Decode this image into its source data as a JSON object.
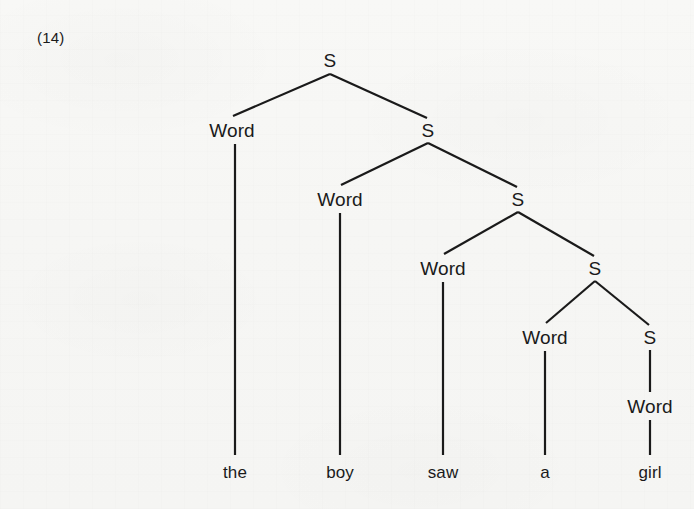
{
  "example": {
    "number_label": "(14)"
  },
  "figure": {
    "type": "syntax-tree",
    "sentence": "the boy saw a girl",
    "nonterminal_label": "S",
    "preterminal_label": "Word"
  },
  "tree": {
    "nodes": [
      {
        "id": "S1",
        "label": "S",
        "x": 330,
        "y": 60,
        "kind": "nonterminal"
      },
      {
        "id": "Word1",
        "label": "Word",
        "x": 232,
        "y": 130,
        "kind": "preterminal"
      },
      {
        "id": "S2",
        "label": "S",
        "x": 428,
        "y": 130,
        "kind": "nonterminal"
      },
      {
        "id": "Word2",
        "label": "Word",
        "x": 340,
        "y": 199,
        "kind": "preterminal"
      },
      {
        "id": "S3",
        "label": "S",
        "x": 518,
        "y": 199,
        "kind": "nonterminal"
      },
      {
        "id": "Word3",
        "label": "Word",
        "x": 443,
        "y": 268,
        "kind": "preterminal"
      },
      {
        "id": "S4",
        "label": "S",
        "x": 595,
        "y": 268,
        "kind": "nonterminal"
      },
      {
        "id": "Word4",
        "label": "Word",
        "x": 545,
        "y": 337,
        "kind": "preterminal"
      },
      {
        "id": "S5",
        "label": "S",
        "x": 650,
        "y": 337,
        "kind": "nonterminal"
      },
      {
        "id": "Word5",
        "label": "Word",
        "x": 650,
        "y": 406,
        "kind": "preterminal"
      }
    ],
    "terminals": [
      {
        "id": "t1",
        "label": "the",
        "x": 235,
        "y": 472
      },
      {
        "id": "t2",
        "label": "boy",
        "x": 340,
        "y": 472
      },
      {
        "id": "t3",
        "label": "saw",
        "x": 443,
        "y": 472
      },
      {
        "id": "t4",
        "label": "a",
        "x": 545,
        "y": 472
      },
      {
        "id": "t5",
        "label": "girl",
        "x": 650,
        "y": 472
      }
    ],
    "edges": [
      {
        "from": "S1",
        "to": "Word1",
        "x1": 330,
        "y1": 74,
        "x2": 233,
        "y2": 116
      },
      {
        "from": "S1",
        "to": "S2",
        "x1": 330,
        "y1": 74,
        "x2": 427,
        "y2": 118
      },
      {
        "from": "S2",
        "to": "Word2",
        "x1": 428,
        "y1": 143,
        "x2": 341,
        "y2": 185
      },
      {
        "from": "S2",
        "to": "S3",
        "x1": 428,
        "y1": 143,
        "x2": 517,
        "y2": 187
      },
      {
        "from": "S3",
        "to": "Word3",
        "x1": 518,
        "y1": 212,
        "x2": 444,
        "y2": 254
      },
      {
        "from": "S3",
        "to": "S4",
        "x1": 518,
        "y1": 212,
        "x2": 594,
        "y2": 256
      },
      {
        "from": "S4",
        "to": "Word4",
        "x1": 595,
        "y1": 281,
        "x2": 546,
        "y2": 323
      },
      {
        "from": "S4",
        "to": "S5",
        "x1": 595,
        "y1": 281,
        "x2": 649,
        "y2": 325
      },
      {
        "from": "S5",
        "to": "Word5",
        "x1": 650,
        "y1": 350,
        "x2": 650,
        "y2": 392
      },
      {
        "from": "Word1",
        "to": "t1",
        "x1": 235,
        "y1": 144,
        "x2": 235,
        "y2": 455
      },
      {
        "from": "Word2",
        "to": "t2",
        "x1": 340,
        "y1": 213,
        "x2": 340,
        "y2": 455
      },
      {
        "from": "Word3",
        "to": "t3",
        "x1": 443,
        "y1": 282,
        "x2": 443,
        "y2": 455
      },
      {
        "from": "Word4",
        "to": "t4",
        "x1": 545,
        "y1": 351,
        "x2": 545,
        "y2": 455
      },
      {
        "from": "Word5",
        "to": "t5",
        "x1": 650,
        "y1": 420,
        "x2": 650,
        "y2": 455
      }
    ]
  },
  "style": {
    "ink_color": "#1a1a1a",
    "paper_color": "#f6f6f4",
    "stroke_width": 2.2
  }
}
